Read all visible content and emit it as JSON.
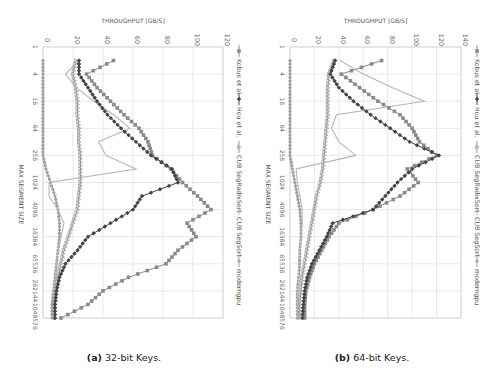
{
  "figure": {
    "captions": [
      {
        "label": "(a)",
        "text": "32-bit Keys."
      },
      {
        "label": "(b)",
        "text": "64-bit Keys."
      }
    ]
  },
  "chart_data": [
    {
      "type": "line",
      "title": "32-bit Keys",
      "orientation": "rotated 90deg clockwise (x-axis vertical, top-to-bottom)",
      "xlabel": "MAX SEGMENT SIZE",
      "ylabel": "THROUGHPUT [GB/S]",
      "x_scale": "log2",
      "x_tick_labels": [
        "1",
        "4",
        "16",
        "64",
        "256",
        "1024",
        "4096",
        "16384",
        "65536",
        "262144",
        "1048576"
      ],
      "x": [
        1,
        2,
        4,
        8,
        16,
        32,
        64,
        128,
        256,
        512,
        1024,
        2048,
        4096,
        8192,
        16384,
        32768,
        65536,
        131072,
        262144,
        524288,
        1048576
      ],
      "ylim": [
        0,
        120
      ],
      "y_ticks": [
        0,
        20,
        40,
        60,
        80,
        100,
        120
      ],
      "grid": true,
      "legend_position": "right (top when rotated)",
      "series": [
        {
          "name": "Kobus et al.",
          "marker": "square",
          "color": "#8a8a8a",
          "values": [
            null,
            47,
            29,
            36,
            45,
            54,
            64,
            70,
            73,
            85,
            93,
            103,
            112,
            96,
            102,
            90,
            82,
            57,
            40,
            30,
            12
          ]
        },
        {
          "name": "Hou et al.",
          "marker": "diamond",
          "color": "#444444",
          "values": [
            null,
            24,
            24,
            30,
            36,
            43,
            52,
            62,
            72,
            86,
            90,
            66,
            60,
            45,
            30,
            23,
            15,
            11,
            9,
            8,
            8
          ]
        },
        {
          "name": "CUB SegRadixSort",
          "marker": "triangle",
          "color": "#999999",
          "values": [
            null,
            22,
            20,
            22,
            23,
            23,
            24,
            24,
            25,
            25,
            25,
            24,
            23,
            20,
            17,
            14,
            12,
            10,
            9,
            8,
            8
          ]
        },
        {
          "name": "CUB SegSort",
          "marker": "none",
          "color": "#b5b5b5",
          "values": [
            null,
            24,
            15,
            22,
            34,
            47,
            58,
            37,
            42,
            62,
            4,
            4,
            10,
            14,
            12,
            10,
            9,
            8,
            7,
            7,
            7
          ]
        },
        {
          "name": "moderngpu",
          "marker": "circle",
          "color": "#a0a0a0",
          "values": [
            null,
            0,
            0,
            0,
            0,
            0,
            0,
            0,
            0,
            2,
            5,
            8,
            10,
            11,
            11,
            10,
            9,
            8,
            7,
            6,
            6
          ]
        }
      ]
    },
    {
      "type": "line",
      "title": "64-bit Keys",
      "orientation": "rotated 90deg clockwise (x-axis vertical, top-to-bottom)",
      "xlabel": "MAX SEGMENT SIZE",
      "ylabel": "THROUGHPUT [GB/S]",
      "x_scale": "log2",
      "x_tick_labels": [
        "1",
        "4",
        "16",
        "64",
        "256",
        "1024",
        "4096",
        "16384",
        "65536",
        "262144",
        "1048576"
      ],
      "x": [
        1,
        2,
        4,
        8,
        16,
        32,
        64,
        128,
        256,
        512,
        1024,
        2048,
        4096,
        8192,
        16384,
        32768,
        65536,
        131072,
        262144,
        524288,
        1048576
      ],
      "ylim": [
        0,
        140
      ],
      "y_ticks": [
        0,
        20,
        40,
        60,
        80,
        100,
        120,
        140
      ],
      "grid": true,
      "legend_position": "right (top when rotated)",
      "series": [
        {
          "name": "Kobus et al.",
          "marker": "square",
          "color": "#8a8a8a",
          "values": [
            null,
            75,
            42,
            57,
            72,
            90,
            100,
            106,
            120,
            96,
            105,
            90,
            68,
            40,
            32,
            26,
            20,
            16,
            13,
            12,
            12
          ]
        },
        {
          "name": "Hou et al.",
          "marker": "diamond",
          "color": "#444444",
          "values": [
            null,
            37,
            33,
            40,
            52,
            66,
            82,
            98,
            122,
            100,
            88,
            78,
            68,
            35,
            30,
            24,
            18,
            14,
            12,
            11,
            10
          ]
        },
        {
          "name": "CUB SegRadixSort",
          "marker": "triangle",
          "color": "#999999",
          "values": [
            null,
            36,
            32,
            31,
            31,
            31,
            30,
            29,
            28,
            27,
            25,
            22,
            20,
            18,
            16,
            14,
            12,
            10,
            9,
            8,
            8
          ]
        },
        {
          "name": "CUB SegSort",
          "marker": "none",
          "color": "#b5b5b5",
          "values": [
            null,
            41,
            60,
            84,
            110,
            38,
            34,
            40,
            54,
            5,
            6,
            8,
            10,
            10,
            9,
            8,
            7,
            7,
            6,
            6,
            6
          ]
        },
        {
          "name": "moderngpu",
          "marker": "circle",
          "color": "#a0a0a0",
          "values": [
            null,
            0,
            0,
            0,
            0,
            0,
            0,
            0,
            0,
            2,
            4,
            6,
            8,
            9,
            9,
            8,
            8,
            7,
            6,
            6,
            6
          ]
        }
      ]
    }
  ]
}
